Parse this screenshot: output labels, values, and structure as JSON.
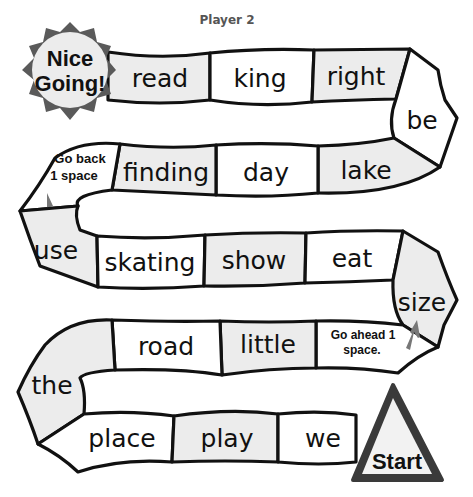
{
  "header": {
    "title": "Player 2"
  },
  "board": {
    "finish": {
      "line1": "Nice",
      "line2": "Going!",
      "color": "#5a5a5a"
    },
    "start": {
      "label": "Start",
      "color": "#3a3a3a"
    },
    "tiles": [
      {
        "label": "read",
        "shade": "gray"
      },
      {
        "label": "king",
        "shade": "white"
      },
      {
        "label": "right",
        "shade": "gray"
      },
      {
        "label": "be",
        "shade": "white"
      },
      {
        "label": "lake",
        "shade": "gray"
      },
      {
        "label": "day",
        "shade": "white"
      },
      {
        "label": "finding",
        "shade": "gray"
      },
      {
        "label": "Go back 1 space",
        "line1": "Go back",
        "line2": "1 space",
        "shade": "white"
      },
      {
        "label": "use",
        "shade": "gray"
      },
      {
        "label": "skating",
        "shade": "white"
      },
      {
        "label": "show",
        "shade": "gray"
      },
      {
        "label": "eat",
        "shade": "white"
      },
      {
        "label": "size",
        "shade": "gray"
      },
      {
        "label": "Go ahead 1 space.",
        "line1": "Go ahead 1",
        "line2": "space.",
        "shade": "white"
      },
      {
        "label": "little",
        "shade": "gray"
      },
      {
        "label": "road",
        "shade": "white"
      },
      {
        "label": "the",
        "shade": "gray"
      },
      {
        "label": "place",
        "shade": "white"
      },
      {
        "label": "play",
        "shade": "gray"
      },
      {
        "label": "we",
        "shade": "white"
      }
    ],
    "arrow_color": "#777777"
  }
}
